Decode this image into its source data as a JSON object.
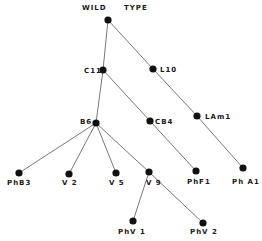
{
  "diagram": {
    "type": "tree",
    "root_label": "WILD TYPE",
    "nodes": [
      {
        "id": "WT",
        "label": "",
        "x": 108,
        "y": 20
      },
      {
        "id": "C11",
        "label": "C11",
        "x": 103,
        "y": 70
      },
      {
        "id": "L10",
        "label": "L10",
        "x": 153,
        "y": 69
      },
      {
        "id": "B6",
        "label": "B6",
        "x": 96,
        "y": 123
      },
      {
        "id": "CB4",
        "label": "CB4",
        "x": 150,
        "y": 121
      },
      {
        "id": "LAm1",
        "label": "LAm1",
        "x": 197,
        "y": 116
      },
      {
        "id": "PhB3",
        "label": "PhB3",
        "x": 19,
        "y": 173
      },
      {
        "id": "V2",
        "label": "V 2",
        "x": 69,
        "y": 174
      },
      {
        "id": "V5",
        "label": "V 5",
        "x": 116,
        "y": 173
      },
      {
        "id": "V9",
        "label": "V 9",
        "x": 149,
        "y": 172
      },
      {
        "id": "PhF1",
        "label": "PhF1",
        "x": 196,
        "y": 171
      },
      {
        "id": "PhA1",
        "label": "Ph A1",
        "x": 243,
        "y": 168
      },
      {
        "id": "PhV1",
        "label": "PhV 1",
        "x": 133,
        "y": 221
      },
      {
        "id": "PhV2",
        "label": "PhV 2",
        "x": 203,
        "y": 223
      }
    ],
    "edges": [
      [
        "WT",
        "C11"
      ],
      [
        "WT",
        "L10"
      ],
      [
        "L10",
        "LAm1"
      ],
      [
        "LAm1",
        "PhA1"
      ],
      [
        "C11",
        "B6"
      ],
      [
        "C11",
        "CB4"
      ],
      [
        "CB4",
        "PhF1"
      ],
      [
        "B6",
        "PhB3"
      ],
      [
        "B6",
        "V2"
      ],
      [
        "B6",
        "V5"
      ],
      [
        "B6",
        "V9"
      ],
      [
        "V9",
        "PhV1"
      ],
      [
        "V9",
        "PhV2"
      ]
    ]
  },
  "labels": {
    "wild": "WILD",
    "type": "TYPE",
    "c11": "C11",
    "l10": "L10",
    "b6": "B6",
    "cb4": "CB4",
    "lam1": "LAm1",
    "phb3": "PhB3",
    "v2": "V 2",
    "v5": "V 5",
    "v9": "V 9",
    "phf1": "PhF1",
    "pha1": "Ph A1",
    "phv1": "PhV 1",
    "phv2": "PhV 2"
  }
}
